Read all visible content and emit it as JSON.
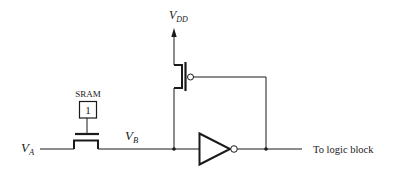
{
  "diagram": {
    "type": "circuit-schematic",
    "labels": {
      "input_node": {
        "main": "V",
        "sub": "A"
      },
      "internal_node": {
        "main": "V",
        "sub": "B"
      },
      "supply": {
        "main": "V",
        "sub": "DD"
      },
      "sram": "SRAM",
      "sram_value": "1",
      "output": "To logic block"
    },
    "components": [
      {
        "id": "pass-nmos",
        "kind": "NMOS pass transistor",
        "gate": "SRAM",
        "from": "V_A",
        "to": "V_B"
      },
      {
        "id": "sram-cell",
        "kind": "SRAM bit",
        "value": "1"
      },
      {
        "id": "keeper-pmos",
        "kind": "PMOS",
        "source": "V_DD",
        "drain": "V_B",
        "gate": "inverter output"
      },
      {
        "id": "inverter",
        "kind": "Inverter",
        "input": "V_B",
        "output": "To logic block"
      }
    ],
    "colors": {
      "stroke": "#1a1a1a",
      "background": "#ffffff"
    }
  }
}
